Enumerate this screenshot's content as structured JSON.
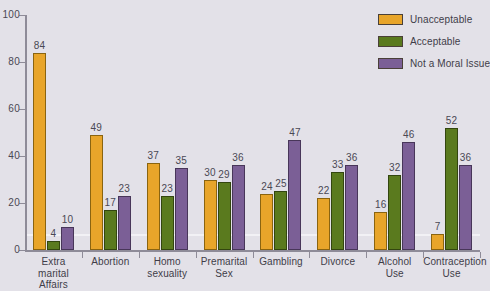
{
  "chart_data": {
    "type": "bar",
    "title": "",
    "xlabel": "",
    "ylabel": "",
    "ylim": [
      0,
      100
    ],
    "yticks": [
      0,
      20,
      40,
      60,
      80,
      100
    ],
    "grid": false,
    "legend_position": "top-right",
    "categories": [
      "Extra marital Affairs",
      "Abortion",
      "Homo sexuality",
      "Premarital Sex",
      "Gambling",
      "Divorce",
      "Alcohol Use",
      "Contraception Use"
    ],
    "category_lines": [
      [
        "Extra marital",
        "Affairs"
      ],
      [
        "Abortion"
      ],
      [
        "Homo",
        "sexuality"
      ],
      [
        "Premarital",
        "Sex"
      ],
      [
        "Gambling"
      ],
      [
        "Divorce"
      ],
      [
        "Alcohol",
        "Use"
      ],
      [
        "Contraception",
        "Use"
      ]
    ],
    "series": [
      {
        "name": "Unacceptable",
        "color": "#e8a52a",
        "values": [
          84,
          49,
          37,
          30,
          24,
          22,
          16,
          7
        ]
      },
      {
        "name": "Acceptable",
        "color": "#5a7a1e",
        "values": [
          4,
          17,
          23,
          29,
          25,
          33,
          32,
          52
        ]
      },
      {
        "name": "Not a Moral Issue",
        "color": "#7b5f96",
        "values": [
          10,
          23,
          35,
          36,
          47,
          36,
          46,
          36
        ]
      }
    ]
  },
  "colors": {
    "background": "#e3e1e8",
    "axis": "#8e8b98",
    "text": "#3f3d48",
    "unacceptable": "#e8a52a",
    "acceptable": "#5a7a1e",
    "not_a_moral_issue": "#7b5f96"
  }
}
